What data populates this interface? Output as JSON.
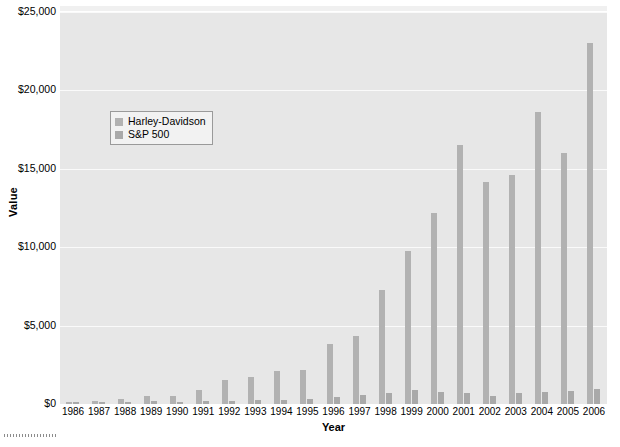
{
  "chart_data": {
    "type": "bar",
    "title": "",
    "xlabel": "Year",
    "ylabel": "Value",
    "ylim": [
      0,
      25000
    ],
    "ytick_values": [
      0,
      5000,
      10000,
      15000,
      20000,
      25000
    ],
    "ytick_labels": [
      "$0",
      "$5,000",
      "$10,000",
      "$15,000",
      "$20,000",
      "$25,000"
    ],
    "grid": true,
    "legend_position": "upper-left-inside",
    "categories": [
      "1986",
      "1987",
      "1988",
      "1989",
      "1990",
      "1991",
      "1992",
      "1993",
      "1994",
      "1995",
      "1996",
      "1997",
      "1998",
      "1999",
      "2000",
      "2001",
      "2002",
      "2003",
      "2004",
      "2005",
      "2006"
    ],
    "series": [
      {
        "name": "Harley-Davidson",
        "color": "#b2b2b2",
        "values": [
          100,
          180,
          330,
          520,
          540,
          900,
          1500,
          1750,
          2100,
          2200,
          3850,
          4350,
          7300,
          9750,
          12200,
          16500,
          14150,
          14600,
          18600,
          16000,
          23000
        ]
      },
      {
        "name": "S&P 500",
        "color": "#a9a9a9",
        "values": [
          100,
          105,
          123,
          162,
          157,
          205,
          220,
          242,
          246,
          338,
          416,
          554,
          713,
          863,
          784,
          691,
          538,
          693,
          768,
          806,
          933
        ]
      }
    ]
  },
  "legend": {
    "entries": [
      {
        "label": "Harley-Davidson"
      },
      {
        "label": "S&P 500"
      }
    ]
  },
  "axes": {
    "y_title": "Value",
    "x_title": "Year"
  }
}
